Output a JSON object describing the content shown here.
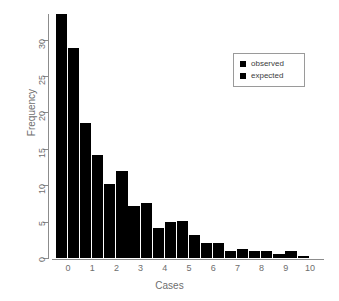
{
  "chart_data": {
    "type": "bar",
    "title": "",
    "xlabel": "Cases",
    "ylabel": "Frequency",
    "categories": [
      "0",
      "1",
      "2",
      "3",
      "4",
      "5",
      "6",
      "7",
      "8",
      "9",
      "10"
    ],
    "series": [
      {
        "name": "observed",
        "values": [
          33.5,
          18.5,
          10.1,
          7.1,
          4.1,
          5.1,
          2.1,
          1.0,
          1.0,
          0.6,
          0.3
        ]
      },
      {
        "name": "expected",
        "values": [
          28.8,
          14.1,
          11.9,
          7.6,
          4.9,
          3.2,
          2.1,
          1.2,
          0.9,
          1.0,
          0.0
        ]
      }
    ],
    "xlim": [
      0,
      11
    ],
    "ylim": [
      0,
      33.5
    ],
    "yticks": [
      0,
      5,
      10,
      15,
      20,
      25,
      30
    ],
    "grid": false,
    "bar_color": "#000000",
    "axis_color": "#8c8c8c",
    "label_color": "#6e6e6e",
    "legend": {
      "position": "top-right",
      "entries": [
        "observed",
        "expected"
      ],
      "swatch_color": "#000000"
    }
  },
  "legend": {
    "items": [
      {
        "label": "observed",
        "icon": "filled-square-icon"
      },
      {
        "label": "expected",
        "icon": "filled-square-icon"
      }
    ]
  },
  "axes": {
    "y_title": "Frequency",
    "x_title": "Cases",
    "y_ticks": [
      "0",
      "5",
      "10",
      "15",
      "20",
      "25",
      "30"
    ],
    "x_ticks": [
      "0",
      "1",
      "2",
      "3",
      "4",
      "5",
      "6",
      "7",
      "8",
      "9",
      "10"
    ]
  }
}
